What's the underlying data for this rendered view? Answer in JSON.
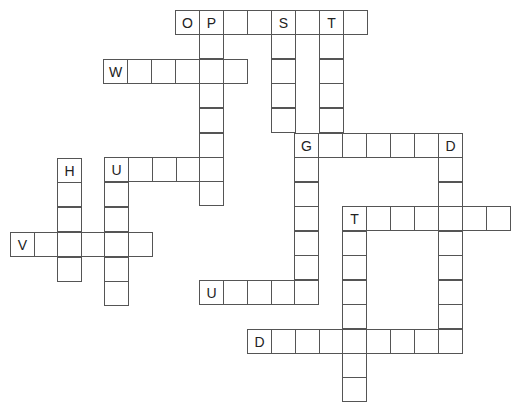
{
  "puzzle": {
    "type": "crossword",
    "cell_size": 24,
    "line_color": "#555555",
    "cells": [
      {
        "x": 175,
        "y": 10,
        "letter": "O"
      },
      {
        "x": 199,
        "y": 10,
        "letter": "P"
      },
      {
        "x": 223,
        "y": 10,
        "letter": ""
      },
      {
        "x": 247,
        "y": 10,
        "letter": ""
      },
      {
        "x": 271,
        "y": 10,
        "letter": "S"
      },
      {
        "x": 295,
        "y": 10,
        "letter": ""
      },
      {
        "x": 319,
        "y": 10,
        "letter": "T"
      },
      {
        "x": 343,
        "y": 10,
        "letter": ""
      },
      {
        "x": 199,
        "y": 34,
        "letter": ""
      },
      {
        "x": 199,
        "y": 83,
        "letter": ""
      },
      {
        "x": 199,
        "y": 108,
        "letter": ""
      },
      {
        "x": 199,
        "y": 133,
        "letter": ""
      },
      {
        "x": 199,
        "y": 181,
        "letter": ""
      },
      {
        "x": 103,
        "y": 59,
        "letter": "W"
      },
      {
        "x": 127,
        "y": 59,
        "letter": ""
      },
      {
        "x": 151,
        "y": 59,
        "letter": ""
      },
      {
        "x": 175,
        "y": 59,
        "letter": ""
      },
      {
        "x": 199,
        "y": 59,
        "letter": ""
      },
      {
        "x": 223,
        "y": 59,
        "letter": ""
      },
      {
        "x": 271,
        "y": 34,
        "letter": ""
      },
      {
        "x": 271,
        "y": 59,
        "letter": ""
      },
      {
        "x": 271,
        "y": 83,
        "letter": ""
      },
      {
        "x": 271,
        "y": 108,
        "letter": ""
      },
      {
        "x": 319,
        "y": 34,
        "letter": ""
      },
      {
        "x": 319,
        "y": 59,
        "letter": ""
      },
      {
        "x": 319,
        "y": 83,
        "letter": ""
      },
      {
        "x": 319,
        "y": 108,
        "letter": ""
      },
      {
        "x": 294,
        "y": 133,
        "letter": "G"
      },
      {
        "x": 318,
        "y": 133,
        "letter": ""
      },
      {
        "x": 342,
        "y": 133,
        "letter": ""
      },
      {
        "x": 366,
        "y": 133,
        "letter": ""
      },
      {
        "x": 390,
        "y": 133,
        "letter": ""
      },
      {
        "x": 414,
        "y": 133,
        "letter": ""
      },
      {
        "x": 438,
        "y": 133,
        "letter": "D"
      },
      {
        "x": 294,
        "y": 157,
        "letter": ""
      },
      {
        "x": 294,
        "y": 182,
        "letter": ""
      },
      {
        "x": 294,
        "y": 206,
        "letter": ""
      },
      {
        "x": 294,
        "y": 231,
        "letter": ""
      },
      {
        "x": 294,
        "y": 255,
        "letter": ""
      },
      {
        "x": 438,
        "y": 157,
        "letter": ""
      },
      {
        "x": 438,
        "y": 182,
        "letter": ""
      },
      {
        "x": 438,
        "y": 206,
        "letter": ""
      },
      {
        "x": 438,
        "y": 231,
        "letter": ""
      },
      {
        "x": 438,
        "y": 255,
        "letter": ""
      },
      {
        "x": 438,
        "y": 280,
        "letter": ""
      },
      {
        "x": 438,
        "y": 304,
        "letter": ""
      },
      {
        "x": 57,
        "y": 158,
        "letter": "H"
      },
      {
        "x": 57,
        "y": 182,
        "letter": ""
      },
      {
        "x": 57,
        "y": 207,
        "letter": ""
      },
      {
        "x": 57,
        "y": 257,
        "letter": ""
      },
      {
        "x": 104,
        "y": 157,
        "letter": "U"
      },
      {
        "x": 128,
        "y": 157,
        "letter": ""
      },
      {
        "x": 152,
        "y": 157,
        "letter": ""
      },
      {
        "x": 176,
        "y": 157,
        "letter": ""
      },
      {
        "x": 199,
        "y": 157,
        "letter": ""
      },
      {
        "x": 104,
        "y": 182,
        "letter": ""
      },
      {
        "x": 104,
        "y": 207,
        "letter": ""
      },
      {
        "x": 104,
        "y": 257,
        "letter": ""
      },
      {
        "x": 104,
        "y": 281,
        "letter": ""
      },
      {
        "x": 10,
        "y": 232,
        "letter": "V"
      },
      {
        "x": 34,
        "y": 232,
        "letter": ""
      },
      {
        "x": 57,
        "y": 232,
        "letter": ""
      },
      {
        "x": 81,
        "y": 232,
        "letter": ""
      },
      {
        "x": 104,
        "y": 232,
        "letter": ""
      },
      {
        "x": 128,
        "y": 232,
        "letter": ""
      },
      {
        "x": 342,
        "y": 206,
        "letter": "T"
      },
      {
        "x": 366,
        "y": 206,
        "letter": ""
      },
      {
        "x": 390,
        "y": 206,
        "letter": ""
      },
      {
        "x": 414,
        "y": 206,
        "letter": ""
      },
      {
        "x": 462,
        "y": 206,
        "letter": ""
      },
      {
        "x": 486,
        "y": 206,
        "letter": ""
      },
      {
        "x": 342,
        "y": 231,
        "letter": ""
      },
      {
        "x": 342,
        "y": 255,
        "letter": ""
      },
      {
        "x": 342,
        "y": 280,
        "letter": ""
      },
      {
        "x": 342,
        "y": 304,
        "letter": ""
      },
      {
        "x": 342,
        "y": 353,
        "letter": ""
      },
      {
        "x": 342,
        "y": 377,
        "letter": ""
      },
      {
        "x": 199,
        "y": 280,
        "letter": "U"
      },
      {
        "x": 223,
        "y": 280,
        "letter": ""
      },
      {
        "x": 247,
        "y": 280,
        "letter": ""
      },
      {
        "x": 271,
        "y": 280,
        "letter": ""
      },
      {
        "x": 294,
        "y": 280,
        "letter": ""
      },
      {
        "x": 247,
        "y": 329,
        "letter": "D"
      },
      {
        "x": 271,
        "y": 329,
        "letter": ""
      },
      {
        "x": 295,
        "y": 329,
        "letter": ""
      },
      {
        "x": 319,
        "y": 329,
        "letter": ""
      },
      {
        "x": 342,
        "y": 329,
        "letter": ""
      },
      {
        "x": 366,
        "y": 329,
        "letter": ""
      },
      {
        "x": 390,
        "y": 329,
        "letter": ""
      },
      {
        "x": 414,
        "y": 329,
        "letter": ""
      },
      {
        "x": 438,
        "y": 329,
        "letter": ""
      }
    ]
  }
}
